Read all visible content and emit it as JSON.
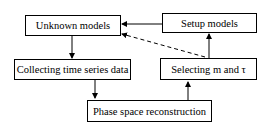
{
  "diagram": {
    "nodes": [
      {
        "id": "unknown",
        "label": "Unknown models"
      },
      {
        "id": "setup",
        "label": "Setup models"
      },
      {
        "id": "collect",
        "label": "Collecting time series data"
      },
      {
        "id": "select",
        "label": "Selecting m and τ"
      },
      {
        "id": "phase",
        "label": "Phase space reconstruction"
      }
    ],
    "edges": [
      {
        "from": "unknown",
        "to": "collect",
        "style": "solid"
      },
      {
        "from": "collect",
        "to": "phase",
        "style": "solid"
      },
      {
        "from": "phase",
        "to": "select",
        "style": "solid"
      },
      {
        "from": "select",
        "to": "setup",
        "style": "solid"
      },
      {
        "from": "setup",
        "to": "unknown",
        "style": "solid"
      },
      {
        "from": "select",
        "to": "unknown",
        "style": "dashed"
      }
    ]
  }
}
